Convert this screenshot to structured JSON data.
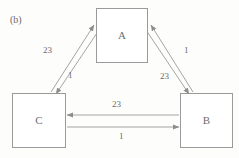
{
  "figure": {
    "panel_label": "(b)",
    "width": 239,
    "height": 158,
    "background_color": "#fdfdfc",
    "stroke_color": "#9a9a9a",
    "text_color": "#6b6b6b",
    "box_fill_color": "#ffffff"
  },
  "nodes": [
    {
      "id": "A",
      "label": "A",
      "x": 96,
      "y": 8,
      "w": 52,
      "h": 55
    },
    {
      "id": "C",
      "label": "C",
      "x": 12,
      "y": 93,
      "w": 54,
      "h": 55
    },
    {
      "id": "B",
      "label": "B",
      "x": 180,
      "y": 93,
      "w": 53,
      "h": 55
    }
  ],
  "edge_labels": [
    {
      "id": "c-to-a-weight",
      "text": "23",
      "x": 43,
      "y": 46
    },
    {
      "id": "a-to-c-weight",
      "text": "1",
      "x": 68,
      "y": 71
    },
    {
      "id": "b-to-a-weight",
      "text": "1",
      "x": 184,
      "y": 46
    },
    {
      "id": "a-to-b-weight",
      "text": "23",
      "x": 160,
      "y": 72
    },
    {
      "id": "b-to-c-weight",
      "text": "23",
      "x": 112,
      "y": 100
    },
    {
      "id": "c-to-b-weight",
      "text": "1",
      "x": 119,
      "y": 132
    }
  ],
  "edges": [
    {
      "id": "edge-c-to-a",
      "from": "C",
      "to": "A",
      "weight": "23",
      "direction": "C→A"
    },
    {
      "id": "edge-a-to-c",
      "from": "A",
      "to": "C",
      "weight": "1",
      "direction": "A→C"
    },
    {
      "id": "edge-b-to-a",
      "from": "B",
      "to": "A",
      "weight": "1",
      "direction": "B→A"
    },
    {
      "id": "edge-a-to-b",
      "from": "A",
      "to": "B",
      "weight": "23",
      "direction": "A→B"
    },
    {
      "id": "edge-b-to-c",
      "from": "B",
      "to": "C",
      "weight": "23",
      "direction": "B→C"
    },
    {
      "id": "edge-c-to-b",
      "from": "C",
      "to": "B",
      "weight": "1",
      "direction": "C→B"
    }
  ]
}
